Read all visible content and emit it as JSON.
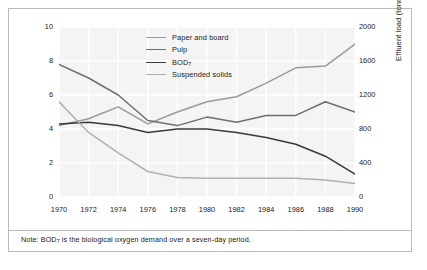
{
  "note": {
    "prefix": "Note: BOD",
    "sub": "7",
    "suffix": " is the biological oxygen demand over a seven-day period."
  },
  "legend": [
    {
      "label": "Paper and board",
      "color": "#9a9a9a"
    },
    {
      "label": "Pulp",
      "color": "#6e6e6e"
    },
    {
      "label": "BOD",
      "sub": "7",
      "color": "#3a3a3a"
    },
    {
      "label": "Suspended solids",
      "color": "#b0b0b0"
    }
  ],
  "chart_data": {
    "type": "line",
    "title": "",
    "xlabel": "",
    "ylabel": "Production (million tonnes/year)",
    "y2label": "Effluent load (tonnes/day)",
    "x": [
      1970,
      1972,
      1974,
      1976,
      1978,
      1980,
      1982,
      1984,
      1986,
      1988,
      1990
    ],
    "xtick_labels": [
      "1970",
      "1972",
      "1974",
      "1976",
      "1978",
      "1980",
      "1982",
      "1984",
      "1986",
      "1988",
      "1990"
    ],
    "xlim": [
      1970,
      1990
    ],
    "ylim": [
      0,
      10
    ],
    "ytick_labels": [
      "0",
      "2",
      "4",
      "6",
      "8",
      "10"
    ],
    "ytick_values": [
      0,
      2,
      4,
      6,
      8,
      10
    ],
    "y2lim": [
      0,
      2000
    ],
    "y2tick_labels": [
      "0",
      "400",
      "800",
      "1200",
      "1600",
      "2000"
    ],
    "y2tick_values": [
      0,
      400,
      800,
      1200,
      1600,
      2000
    ],
    "grid": true,
    "legend_position": "upper center",
    "series": [
      {
        "name": "Paper and board",
        "axis": "left",
        "color": "#9a9a9a",
        "values": [
          4.2,
          4.6,
          5.3,
          4.3,
          5.0,
          5.6,
          5.9,
          6.7,
          7.6,
          7.7,
          9.0
        ]
      },
      {
        "name": "Pulp",
        "axis": "left",
        "color": "#6e6e6e",
        "values": [
          7.8,
          7.0,
          6.0,
          4.5,
          4.2,
          4.7,
          4.4,
          4.8,
          4.8,
          5.6,
          5.0
        ]
      },
      {
        "name": "BOD7",
        "axis": "right",
        "color": "#3a3a3a",
        "values": [
          860,
          880,
          840,
          760,
          800,
          800,
          760,
          700,
          620,
          480,
          270
        ]
      },
      {
        "name": "Suspended solids",
        "axis": "right",
        "color": "#b0b0b0",
        "values": [
          1120,
          760,
          520,
          300,
          230,
          220,
          220,
          220,
          220,
          200,
          160
        ]
      }
    ]
  }
}
